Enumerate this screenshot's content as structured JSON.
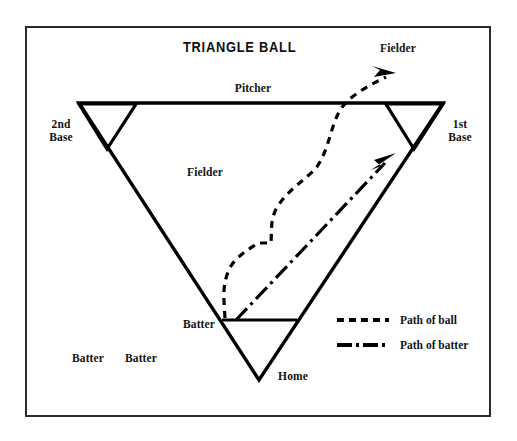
{
  "diagram": {
    "title": "TRIANGLE BALL",
    "type": "sports-field-diagram",
    "frame": {
      "stroke": "#2b2b2b",
      "fill": "#ffffff"
    },
    "line_color": "#000000",
    "text_color": "#141414",
    "labels": [
      {
        "id": "fielder-top-right",
        "text": "Fielder",
        "x": 398,
        "y": 48,
        "align": "center"
      },
      {
        "id": "pitcher",
        "text": "Pitcher",
        "x": 253,
        "y": 88,
        "align": "center"
      },
      {
        "id": "second-base",
        "text": "2nd\nBase",
        "line1": "2nd",
        "line2": "Base",
        "x": 61,
        "y": 124,
        "align": "center"
      },
      {
        "id": "first-base",
        "text": "1st\nBase",
        "line1": "1st",
        "line2": "Base",
        "x": 459,
        "y": 124,
        "align": "center"
      },
      {
        "id": "fielder-center",
        "text": "Fielder",
        "x": 205,
        "y": 172,
        "align": "center"
      },
      {
        "id": "batter-infield",
        "text": "Batter",
        "x": 199,
        "y": 324,
        "align": "center"
      },
      {
        "id": "batter-left-1",
        "text": "Batter",
        "x": 88,
        "y": 358,
        "align": "center"
      },
      {
        "id": "batter-left-2",
        "text": "Batter",
        "x": 141,
        "y": 358,
        "align": "center"
      },
      {
        "id": "home",
        "text": "Home",
        "x": 291,
        "y": 376,
        "align": "center"
      }
    ],
    "legend": {
      "items": [
        {
          "id": "path-of-ball",
          "label": "Path of ball",
          "style": "dashed"
        },
        {
          "id": "path-of-batter",
          "label": "Path of batter",
          "style": "dash-dot"
        }
      ]
    },
    "bases": [
      "2nd Base",
      "1st Base",
      "Home"
    ],
    "positions": [
      "Pitcher",
      "Fielder",
      "Fielder",
      "Batter",
      "Batter",
      "Batter"
    ]
  }
}
